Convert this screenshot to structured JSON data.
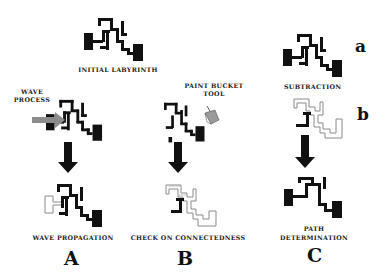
{
  "figure": {
    "top": {
      "title": "INITIAL LABYRINTH"
    },
    "column_a": {
      "input_label_line1": "WAVE",
      "input_label_line2": "PROCESS",
      "result_label": "WAVE PROPAGATION",
      "letter": "A"
    },
    "column_b": {
      "tool_label_line1": "PAINT BUCKET",
      "tool_label_line2": "TOOL",
      "result_label": "CHECK ON CONNECTEDNESS",
      "letter": "B"
    },
    "column_c": {
      "step_a": "a",
      "operation_label": "SUBTRACTION",
      "step_b": "b",
      "result_label_line1": "PATH",
      "result_label_line2": "DETERMINATION",
      "letter": "C"
    },
    "colors": {
      "wall": "#111111",
      "outline": "#8a8a8a",
      "wave_arrow": "#8c8c8c",
      "bucket": "#9a9a9a"
    },
    "icons": [
      "down-arrow-icon",
      "right-arrow-icon",
      "paint-bucket-icon"
    ]
  }
}
